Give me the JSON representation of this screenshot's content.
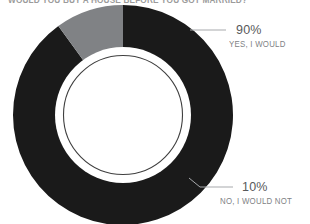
{
  "title": {
    "text": "WOULD YOU BUY A HOUSE BEFORE YOU GOT MARRIED?",
    "cropped": true
  },
  "chart_data": {
    "type": "pie",
    "variant": "donut",
    "title": "WOULD YOU BUY A HOUSE BEFORE YOU GOT MARRIED?",
    "categories": [
      "YES, I WOULD",
      "NO, I WOULD NOT"
    ],
    "values": [
      90,
      10
    ],
    "value_labels": [
      "90%",
      "10%"
    ],
    "unit": "%",
    "colors": [
      "#1a1a1a",
      "#808285"
    ],
    "start_angle_deg": 0,
    "direction": "clockwise",
    "inner_radius_ratio": 0.6,
    "legend": "callout-labels",
    "grid": false,
    "slices": [
      {
        "label": "YES, I WOULD",
        "value": 90,
        "value_label": "90%",
        "color": "#1a1a1a",
        "start_deg": 0,
        "sweep_deg": 324
      },
      {
        "label": "NO, I WOULD NOT",
        "value": 10,
        "value_label": "10%",
        "color": "#808285",
        "start_deg": 324,
        "sweep_deg": 36
      }
    ]
  },
  "callouts": {
    "yes": {
      "percent": "90%",
      "description": "YES, I WOULD"
    },
    "no": {
      "percent": "10%",
      "description": "NO, I WOULD NOT"
    }
  },
  "colors": {
    "slice_primary": "#1a1a1a",
    "slice_secondary": "#808285",
    "percent_text": "#58595b",
    "description_text": "#808285",
    "leader_line": "#a7a9ac",
    "background": "#ffffff"
  }
}
